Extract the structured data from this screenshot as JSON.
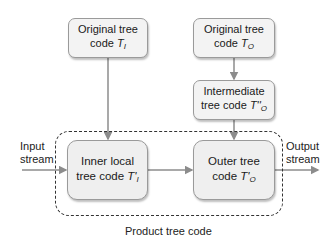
{
  "diagram": {
    "boxes": {
      "orig_i": {
        "line1": "Original tree",
        "line2": "code ",
        "var": "T",
        "sub": "I"
      },
      "orig_o": {
        "line1": "Original tree",
        "line2": "code ",
        "var": "T",
        "sub": "O"
      },
      "intermediate": {
        "line1": "Intermediate",
        "line2": "tree code ",
        "var": "T''",
        "sub": "O"
      },
      "inner": {
        "line1": "Inner local",
        "line2": "tree code ",
        "var": "T'",
        "sub": "I"
      },
      "outer": {
        "line1": "Outer tree",
        "line2": "code ",
        "var": "T'",
        "sub": "O"
      }
    },
    "labels": {
      "input": {
        "line1": "Input",
        "line2": "stream"
      },
      "output": {
        "line1": "Output",
        "line2": "stream"
      },
      "caption": "Product tree code"
    },
    "colors": {
      "arrow": "#8c8c8c",
      "box_fill": "#f3f3f3",
      "box_border": "#9a9a9a",
      "dashed_border": "#333333"
    }
  }
}
